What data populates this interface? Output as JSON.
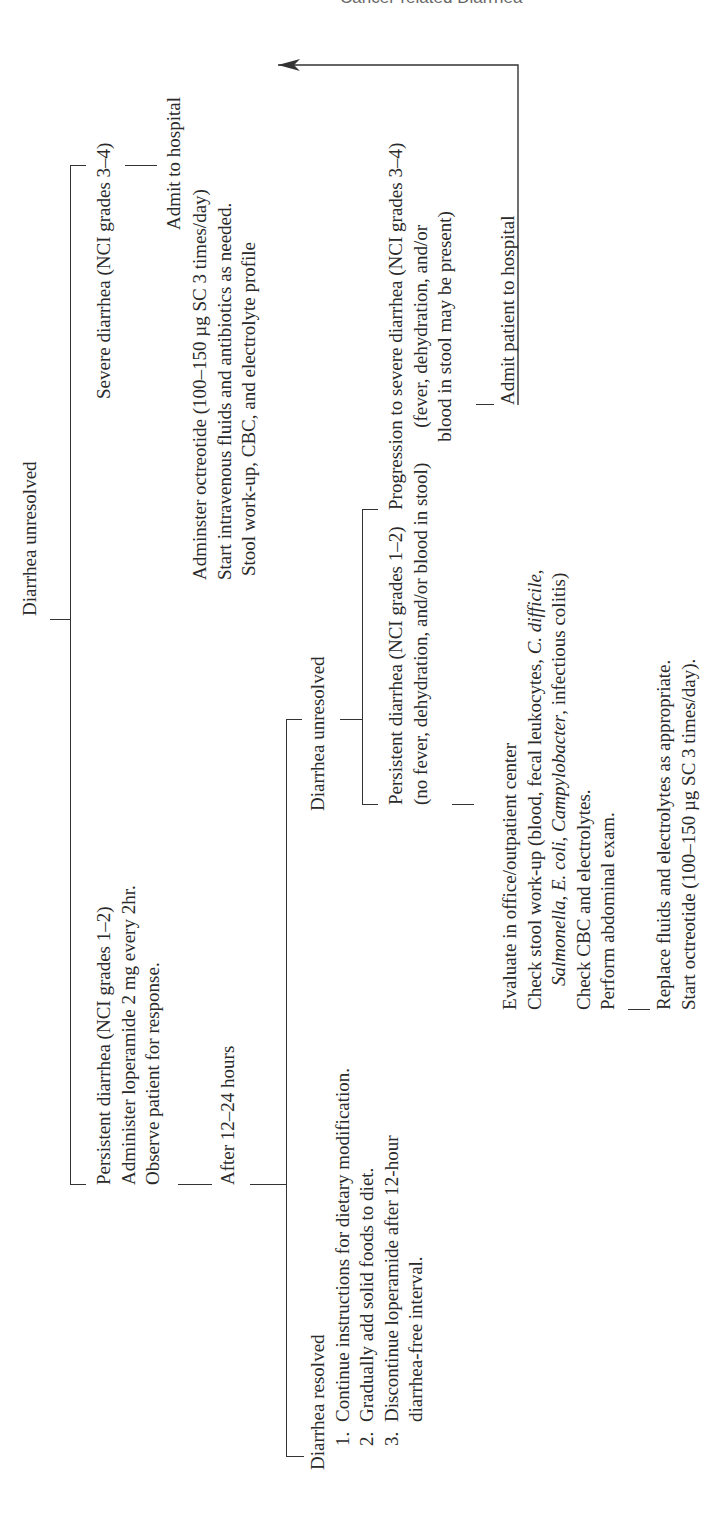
{
  "header": {
    "running_title": "Cancer-related Diarrhea"
  },
  "flowchart": {
    "top_node": "Diarrhea unresolved",
    "severe_branch": {
      "label": "Severe diarrhea (NCI grades 3–4)",
      "admit": "Admit to hospital",
      "actions": [
        "Adminster octreotide (100–150 µg SC 3 times/day)",
        "Start intravenous fluids and antibiotics as needed.",
        "Stool work-up, CBC, and electrolyte profile"
      ]
    },
    "mild_branch": {
      "lines": [
        "Persistent diarrhea (NCI grades 1–2)",
        "Administer loperamide 2 mg every 2hr.",
        "Observe patient for response."
      ],
      "after": "After 12–24 hours"
    },
    "resolved": {
      "title": "Diarrhea resolved",
      "items": [
        {
          "num": "1.",
          "text": "Continue instructions for dietary modification."
        },
        {
          "num": "2.",
          "text": "Gradually add solid foods to diet."
        },
        {
          "num": "3.",
          "text": "Discontinue loperamide after 12-hour",
          "cont": "diarrhea-free interval."
        }
      ]
    },
    "unresolved2": {
      "label": "Diarrhea unresolved",
      "persistent": {
        "line1": "Persistent diarrhea (NCI grades 1–2)",
        "line2": "(no fever, dehydration, and/or blood in stool)"
      },
      "progression": {
        "line1": "Progression to severe diarrhea (NCI grades 3–4)",
        "line2": "(fever, dehydration, and/or",
        "line3": "blood in stool may be present)"
      },
      "admit_patient": "Admit patient to hospital"
    },
    "evaluate": {
      "line1": "Evaluate in office/outpatient center",
      "line2_a": "Check stool work-up (blood, fecal leukocytes, ",
      "line2_i": "C. difficile",
      "line2_b": ",",
      "line3_i1": "Salmonella",
      "line3_a": ", ",
      "line3_i2": "E. coli",
      "line3_b": ", ",
      "line3_i3": "Campylobacter",
      "line3_c": ", infectious colitis)",
      "line4": "Check CBC and electrolytes.",
      "line5": "Perform abdominal exam."
    },
    "replace": {
      "line1": "Replace fluids and electrolytes as appropriate.",
      "line2": "Start octreotide (100–150 µg SC 3 times/day)."
    }
  }
}
